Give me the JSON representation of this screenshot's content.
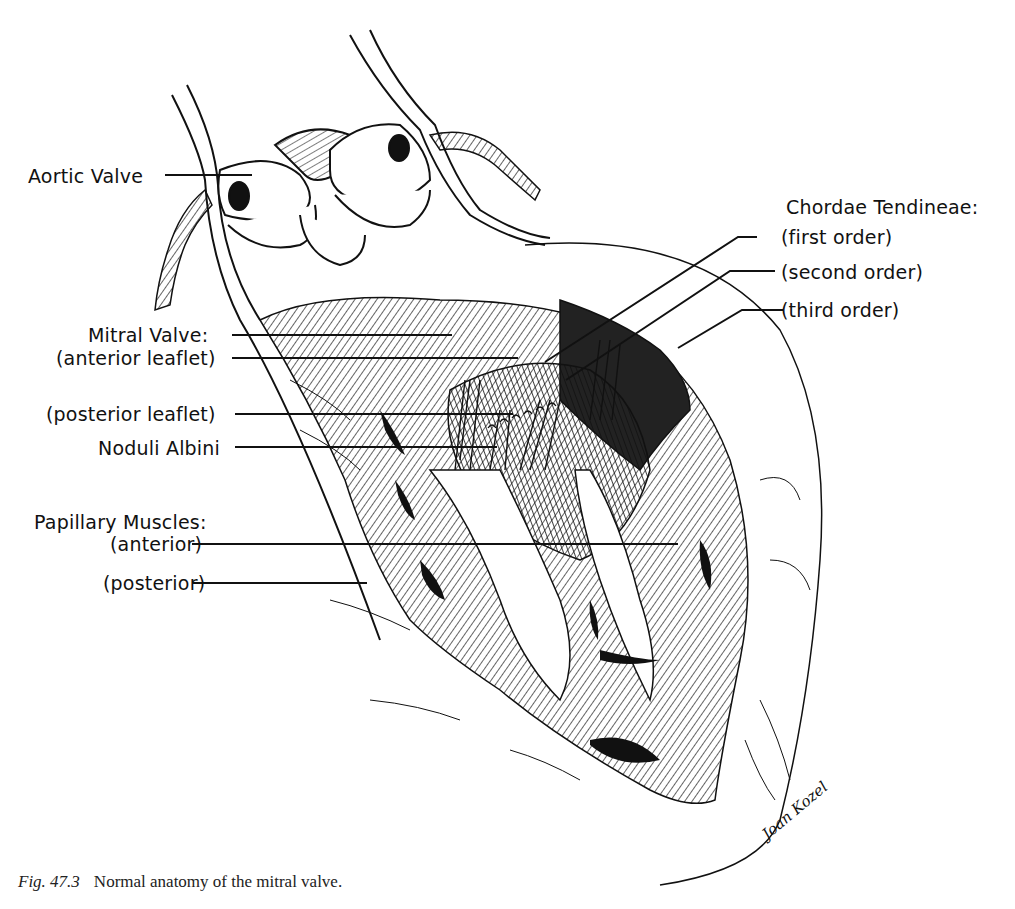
{
  "figure": {
    "caption_number": "Fig. 47.3",
    "caption_text": "Normal anatomy of the mitral valve.",
    "signature": "Joan Kozel"
  },
  "labels": {
    "aortic_valve": "Aortic Valve",
    "mitral_valve": "Mitral Valve:",
    "anterior_leaflet": "(anterior leaflet)",
    "posterior_leaflet": "(posterior leaflet)",
    "noduli_albini": "Noduli Albini",
    "papillary_muscles": "Papillary Muscles:",
    "pm_anterior": "(anterior)",
    "pm_posterior": "(posterior)",
    "chordae_tendineae": "Chordae Tendineae:",
    "ct_first": "(first order)",
    "ct_second": "(second order)",
    "ct_third": "(third order)"
  },
  "colors": {
    "ink": "#111111",
    "paper": "#ffffff"
  }
}
